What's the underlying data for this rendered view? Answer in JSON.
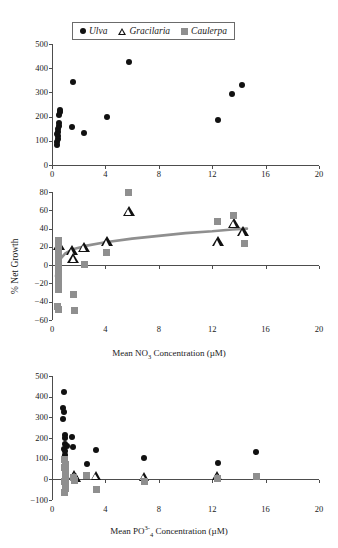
{
  "legend": {
    "items": [
      {
        "label": "Ulva",
        "marker": "filled-circle",
        "color": "#111111"
      },
      {
        "label": "Gracilaria",
        "marker": "open-triangle",
        "color": "#111111"
      },
      {
        "label": "Caulerpa",
        "marker": "filled-square",
        "color": "#8f8f8f"
      }
    ]
  },
  "chart_data": [
    {
      "type": "scatter",
      "panel": "top",
      "title": "",
      "xlabel": "Mean NO3 Concentration (μM)",
      "ylabel": "",
      "xlim": [
        0,
        20
      ],
      "ylim": [
        0,
        500
      ],
      "xticks": [
        0,
        4,
        8,
        12,
        16,
        20
      ],
      "yticks": [
        0,
        100,
        200,
        300,
        400,
        500
      ],
      "grid": false,
      "legend_position": "top-center",
      "series": [
        {
          "name": "Ulva",
          "marker": "filled-circle",
          "color": "#111111",
          "points": [
            [
              0.35,
              82
            ],
            [
              0.4,
              95
            ],
            [
              0.42,
              108
            ],
            [
              0.45,
              118
            ],
            [
              0.4,
              128
            ],
            [
              0.48,
              138
            ],
            [
              0.45,
              150
            ],
            [
              0.5,
              160
            ],
            [
              0.52,
              172
            ],
            [
              0.55,
              205
            ],
            [
              0.58,
              218
            ],
            [
              0.6,
              228
            ],
            [
              1.6,
              345
            ],
            [
              1.5,
              155
            ],
            [
              2.4,
              132
            ],
            [
              4.1,
              198
            ],
            [
              5.75,
              425
            ],
            [
              12.4,
              188
            ],
            [
              13.5,
              292
            ],
            [
              14.2,
              330
            ]
          ]
        }
      ]
    },
    {
      "type": "scatter",
      "panel": "middle",
      "title": "",
      "xlabel": "Mean NO3 Concentration (μM)",
      "ylabel": "% Net Growth",
      "xlim": [
        0,
        20
      ],
      "ylim": [
        -60,
        80
      ],
      "xticks": [
        0,
        4,
        8,
        12,
        16,
        20
      ],
      "yticks": [
        -60,
        -40,
        -20,
        0,
        20,
        40,
        60,
        80
      ],
      "grid": false,
      "fit_curve": {
        "style": "logarithmic",
        "color": "#8f8f8f",
        "points": [
          [
            0.3,
            -12
          ],
          [
            0.45,
            0
          ],
          [
            0.7,
            8
          ],
          [
            1.0,
            13
          ],
          [
            1.5,
            17
          ],
          [
            2.5,
            21
          ],
          [
            4.0,
            25
          ],
          [
            6.0,
            29
          ],
          [
            8.0,
            32
          ],
          [
            10.0,
            35
          ],
          [
            12.0,
            37
          ],
          [
            13.5,
            39
          ],
          [
            14.6,
            40
          ]
        ]
      },
      "series": [
        {
          "name": "Gracilaria",
          "marker": "open-triangle",
          "color": "#111111",
          "points": [
            [
              0.55,
              21
            ],
            [
              1.5,
              15
            ],
            [
              1.6,
              7
            ],
            [
              2.4,
              19
            ],
            [
              4.1,
              25
            ],
            [
              5.75,
              58
            ],
            [
              12.4,
              25
            ],
            [
              13.6,
              45
            ],
            [
              14.3,
              36
            ]
          ]
        },
        {
          "name": "Caulerpa",
          "marker": "filled-square",
          "color": "#8f8f8f",
          "points": [
            [
              0.45,
              27
            ],
            [
              0.5,
              22
            ],
            [
              0.48,
              17
            ],
            [
              0.5,
              10
            ],
            [
              0.52,
              3
            ],
            [
              0.45,
              -5
            ],
            [
              0.5,
              -12
            ],
            [
              0.48,
              -20
            ],
            [
              0.5,
              -27
            ],
            [
              0.42,
              -45
            ],
            [
              0.45,
              -48
            ],
            [
              1.6,
              -32
            ],
            [
              1.65,
              -50
            ],
            [
              2.4,
              1
            ],
            [
              4.1,
              14
            ],
            [
              5.75,
              79
            ],
            [
              12.4,
              48
            ],
            [
              13.6,
              54
            ],
            [
              14.4,
              24
            ]
          ]
        }
      ]
    },
    {
      "type": "scatter",
      "panel": "bottom",
      "title": "",
      "xlabel": "Mean PO4 3- Concentration (μM)",
      "ylabel": "",
      "xlim": [
        0,
        20
      ],
      "ylim": [
        -100,
        500
      ],
      "xticks": [
        0,
        4,
        8,
        12,
        16,
        20
      ],
      "yticks": [
        -100,
        0,
        100,
        200,
        300,
        400,
        500
      ],
      "grid": false,
      "series": [
        {
          "name": "Ulva",
          "marker": "filled-circle",
          "color": "#111111",
          "points": [
            [
              0.9,
              422
            ],
            [
              0.85,
              345
            ],
            [
              0.88,
              325
            ],
            [
              0.85,
              292
            ],
            [
              0.95,
              215
            ],
            [
              1.0,
              198
            ],
            [
              1.5,
              205
            ],
            [
              0.95,
              172
            ],
            [
              1.1,
              160
            ],
            [
              1.55,
              155
            ],
            [
              0.9,
              148
            ],
            [
              1.0,
              135
            ],
            [
              0.95,
              120
            ],
            [
              0.9,
              105
            ],
            [
              1.0,
              95
            ],
            [
              0.95,
              88
            ],
            [
              2.6,
              75
            ],
            [
              3.3,
              142
            ],
            [
              6.9,
              105
            ],
            [
              12.4,
              78
            ],
            [
              15.3,
              132
            ]
          ]
        },
        {
          "name": "Gracilaria",
          "marker": "open-triangle",
          "color": "#111111",
          "points": [
            [
              1.7,
              18
            ],
            [
              1.8,
              5
            ],
            [
              3.3,
              12
            ],
            [
              6.9,
              10
            ],
            [
              12.4,
              12
            ]
          ]
        },
        {
          "name": "Caulerpa",
          "marker": "filled-square",
          "color": "#8f8f8f",
          "points": [
            [
              0.95,
              95
            ],
            [
              1.0,
              72
            ],
            [
              0.95,
              55
            ],
            [
              1.0,
              38
            ],
            [
              0.98,
              20
            ],
            [
              1.0,
              5
            ],
            [
              0.95,
              -10
            ],
            [
              1.0,
              -28
            ],
            [
              0.98,
              -45
            ],
            [
              0.95,
              -62
            ],
            [
              1.6,
              8
            ],
            [
              1.7,
              -5
            ],
            [
              2.6,
              18
            ],
            [
              3.3,
              -48
            ],
            [
              6.9,
              -12
            ],
            [
              12.4,
              5
            ],
            [
              15.3,
              15
            ]
          ]
        }
      ]
    }
  ]
}
